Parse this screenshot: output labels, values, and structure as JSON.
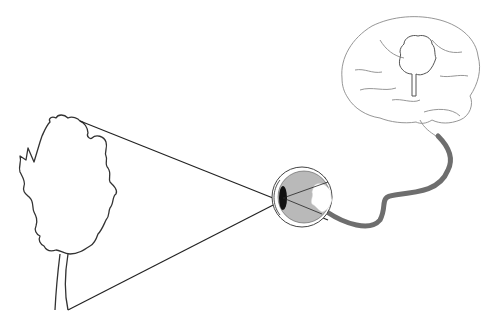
{
  "diagram": {
    "title": "",
    "nodes": [
      {
        "id": "tree",
        "label": "",
        "kind": "object-tree-outline"
      },
      {
        "id": "eye",
        "label": "",
        "kind": "eyeball-cross-section"
      },
      {
        "id": "retina-image",
        "label": "",
        "kind": "inverted-tree-on-retina"
      },
      {
        "id": "optic-nerve",
        "label": "",
        "kind": "nerve"
      },
      {
        "id": "brain",
        "label": "",
        "kind": "brain-sketch"
      },
      {
        "id": "brain-image",
        "label": "",
        "kind": "upright-tree-in-brain"
      }
    ],
    "edges": [
      {
        "from": "tree-top",
        "to": "eye-lens",
        "kind": "light-ray"
      },
      {
        "from": "tree-base",
        "to": "eye-lens",
        "kind": "light-ray"
      },
      {
        "from": "eye",
        "to": "brain",
        "kind": "optic-nerve"
      }
    ],
    "colors": {
      "line": "#333333",
      "nerve": "#6e6e6e",
      "eye_fill": "#b9b9b9",
      "lens": "#111111",
      "brain_line": "#8a8a8a",
      "background": "#ffffff"
    }
  }
}
